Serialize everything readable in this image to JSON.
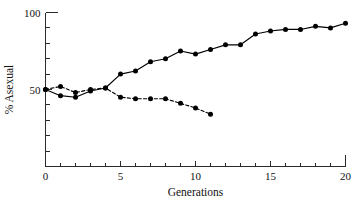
{
  "figure": {
    "background": "#ffffff",
    "ink_color": "#000000"
  },
  "axes": {
    "x_title": "Generations",
    "y_title": "% Asexual",
    "x_ticks": [
      "0",
      "5",
      "10",
      "15",
      "20"
    ],
    "y_ticks": [
      "50",
      "100"
    ]
  },
  "chart_data": {
    "type": "line",
    "title": "",
    "xlabel": "Generations",
    "ylabel": "% Asexual",
    "xlim": [
      0,
      20
    ],
    "ylim": [
      0,
      100
    ],
    "x_tick_values": [
      0,
      5,
      10,
      15,
      20
    ],
    "x_minor_tick_step": 1,
    "y_tick_values": [
      50,
      100
    ],
    "y_minor_tick_step": 10,
    "grid": false,
    "legend": "none",
    "series": [
      {
        "name": "Sexual selection line (increasing)",
        "style": "solid",
        "marker": "filled-circle",
        "x": [
          0,
          1,
          2,
          3,
          4,
          5,
          6,
          7,
          8,
          9,
          10,
          11,
          12,
          13,
          14,
          15,
          16,
          17,
          18,
          19,
          20
        ],
        "values": [
          50,
          46,
          45,
          49,
          51,
          60,
          62,
          68,
          70,
          75,
          73,
          76,
          79,
          79,
          86,
          88,
          89,
          89,
          91,
          90,
          93
        ]
      },
      {
        "name": "Control line (decreasing)",
        "style": "dashed",
        "marker": "filled-circle",
        "x": [
          0,
          1,
          2,
          3,
          4,
          5,
          6,
          7,
          8,
          9,
          10,
          11
        ],
        "values": [
          50,
          52,
          48,
          50,
          51,
          45,
          44,
          44,
          44,
          41,
          38,
          34
        ]
      }
    ]
  }
}
